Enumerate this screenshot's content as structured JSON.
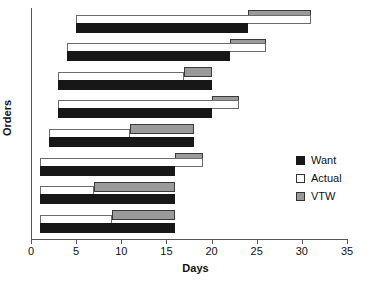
{
  "chart_data": {
    "type": "bar",
    "chart_style": "horizontal-grouped-range-bars",
    "title": "",
    "xlabel": "Days",
    "ylabel": "Orders",
    "xlim": [
      0,
      35
    ],
    "xticks": [
      0,
      5,
      10,
      15,
      20,
      25,
      30,
      35
    ],
    "grid": false,
    "legend_position": "right-middle",
    "legend": [
      {
        "name": "Want",
        "color": "#171717",
        "style": "filled-black"
      },
      {
        "name": "Actual",
        "color": "#ffffff",
        "style": "outlined-white"
      },
      {
        "name": "VTW",
        "color": "#9a9a9a",
        "style": "filled-gray"
      }
    ],
    "series": [
      {
        "name": "Want",
        "starts": [
          5,
          4,
          3,
          3,
          2,
          1,
          1,
          1
        ],
        "ends": [
          24,
          22,
          20,
          20,
          18,
          16,
          16,
          16
        ]
      },
      {
        "name": "Actual",
        "starts": [
          5,
          4,
          3,
          3,
          2,
          1,
          1,
          1
        ],
        "ends": [
          31,
          26,
          17,
          23,
          11,
          19,
          7,
          9
        ]
      },
      {
        "name": "VTW",
        "starts": [
          24,
          22,
          17,
          20,
          11,
          16,
          7,
          9
        ],
        "ends": [
          31,
          26,
          20,
          23,
          18,
          19,
          16,
          16
        ]
      }
    ],
    "categories": [
      "Order 1",
      "Order 2",
      "Order 3",
      "Order 4",
      "Order 5",
      "Order 6",
      "Order 7",
      "Order 8"
    ],
    "groups": [
      {
        "want_start": 5,
        "want_end": 24,
        "actual_start": 5,
        "actual_end": 31,
        "vtw_start": 24,
        "vtw_end": 31
      },
      {
        "want_start": 4,
        "want_end": 22,
        "actual_start": 4,
        "actual_end": 26,
        "vtw_start": 22,
        "vtw_end": 26
      },
      {
        "want_start": 3,
        "want_end": 20,
        "actual_start": 3,
        "actual_end": 17,
        "vtw_start": 17,
        "vtw_end": 20
      },
      {
        "want_start": 3,
        "want_end": 20,
        "actual_start": 3,
        "actual_end": 23,
        "vtw_start": 20,
        "vtw_end": 23
      },
      {
        "want_start": 2,
        "want_end": 18,
        "actual_start": 2,
        "actual_end": 11,
        "vtw_start": 11,
        "vtw_end": 18
      },
      {
        "want_start": 1,
        "want_end": 16,
        "actual_start": 1,
        "actual_end": 19,
        "vtw_start": 16,
        "vtw_end": 19
      },
      {
        "want_start": 1,
        "want_end": 16,
        "actual_start": 1,
        "actual_end": 7,
        "vtw_start": 7,
        "vtw_end": 16
      },
      {
        "want_start": 1,
        "want_end": 16,
        "actual_start": 1,
        "actual_end": 9,
        "vtw_start": 9,
        "vtw_end": 16
      }
    ]
  },
  "axis": {
    "x_title": "Days",
    "y_title": "Orders",
    "tick_labels": [
      "0",
      "5",
      "10",
      "15",
      "20",
      "25",
      "30",
      "35"
    ]
  },
  "legend": {
    "items": [
      {
        "label": "Want"
      },
      {
        "label": "Actual"
      },
      {
        "label": "VTW"
      }
    ]
  }
}
